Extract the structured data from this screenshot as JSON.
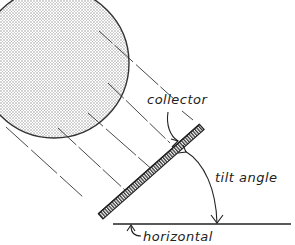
{
  "diagram": {
    "labels": {
      "collector": "collector",
      "tilt_angle": "tilt angle",
      "horizontal": "horizontal"
    },
    "elements": {
      "sun": "stippled circle representing the sun",
      "rays": "parallel solar rays striking collector",
      "collector": "tilted flat-plate collector",
      "horizontal": "horizontal ground reference line",
      "tilt_arc": "arc with arrowheads indicating tilt angle"
    },
    "colors": {
      "ink": "#222222",
      "background": "#ffffff",
      "stipple": "#9a9a9a"
    }
  }
}
